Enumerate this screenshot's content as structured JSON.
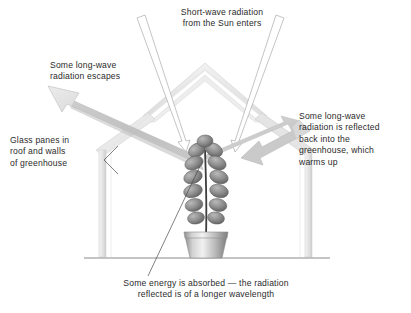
{
  "diagram": {
    "background_color": "#ffffff",
    "text_color": "#2b2b2b",
    "annotations": {
      "short_wave": "Short-wave radiation\nfrom the Sun enters",
      "long_wave_escape": "Some long-wave\nradiation escapes",
      "long_wave_reflected": "Some long-wave\nradiation is reflected\nback into the\ngreenhouse, which\nwarms up",
      "glass_panes": "Glass panes in\nroof and walls\nof greenhouse",
      "energy_absorbed": "Some energy is absorbed — the radiation\nreflected is of a longer wavelength"
    },
    "colors": {
      "greenhouse_frame": "#e8e8e8",
      "greenhouse_frame_edge": "#cfcfcf",
      "thick_arrow_light": "#e4e4e4",
      "thick_arrow_dark": "#a9a9a9",
      "ray_outline": "#b8b8b8",
      "leaf_dark": "#6f6f6f",
      "leaf_light": "#b4b4b4",
      "pot_light": "#efefef",
      "pot_dark": "#7e7e7e",
      "ground_line": "#8a8a8a",
      "leader_line": "#4a4a4a",
      "stem": "#3d3d3d"
    },
    "elements": {
      "greenhouse": "gabled-greenhouse-outline",
      "sun_rays": [
        "left-incoming-ray",
        "right-incoming-ray"
      ],
      "escape_arrow": "up-left-thick-arrow",
      "reflect_arrow": "down-left-bent-thick-arrow",
      "plant": "potted-plant-with-paired-oval-leaves",
      "ground": "horizontal-ground-line",
      "leaders": [
        "glass-panes-fork-leader",
        "absorbed-diagonal-leader"
      ]
    }
  }
}
